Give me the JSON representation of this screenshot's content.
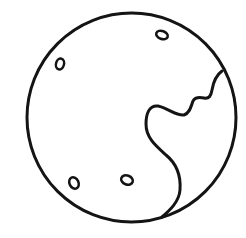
{
  "illustration": {
    "label": "Moon icon",
    "stroke_color": "#141414",
    "fill_color": "#ffffff",
    "background": "#ffffff",
    "stroke_width": 3,
    "body": {
      "cx": 131.5,
      "cy": 117.5,
      "r": 104.5
    },
    "craters": [
      {
        "cx": 162,
        "cy": 35,
        "rx": 6,
        "ry": 4,
        "rotate": 20
      },
      {
        "cx": 60,
        "cy": 64,
        "rx": 4,
        "ry": 5.5,
        "rotate": 15
      },
      {
        "cx": 74,
        "cy": 183,
        "rx": 4.5,
        "ry": 6,
        "rotate": -25
      },
      {
        "cx": 127,
        "cy": 180,
        "rx": 6,
        "ry": 4.5,
        "rotate": 20
      }
    ],
    "coastline": "M222,71 C215,76 213,84 212,90 C211,96 209,99 204,98 C199,97 195,97 193,101 C191,106 190,113 184,115 C176,116 168,108 158,106 C149,105 146,114 146,124 C146,138 156,146 166,155 C177,164 181,176 180,190 C179,202 170,210 162,217"
  }
}
